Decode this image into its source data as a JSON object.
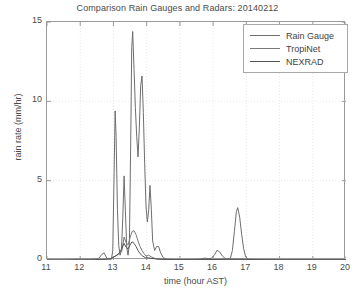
{
  "chart_data": {
    "type": "line",
    "title": "Comparison Rain Gauges and Radars: 20140212",
    "xlabel": "time (hour AST)",
    "ylabel": "rain rate (mm/hr)",
    "xlim": [
      11,
      20
    ],
    "ylim": [
      0,
      15
    ],
    "xticks": [
      11,
      12,
      13,
      14,
      15,
      16,
      17,
      18,
      19,
      20
    ],
    "yticks": [
      0,
      5,
      10,
      15
    ],
    "grid": true,
    "grid_style": "dotted",
    "legend_position": "top-right",
    "colors": {
      "rain_gauge": "#6e6e6e",
      "tropinet": "#7a7a7a",
      "nexrad": "#565656",
      "axes": "#9a9a9a",
      "grid": "#e8e8e8",
      "text": "#4a4a4a"
    },
    "series": [
      {
        "name": "Rain Gauge",
        "color": "#6e6e6e",
        "points": [
          [
            11.0,
            0.0
          ],
          [
            11.6,
            0.0
          ],
          [
            11.95,
            0.05
          ],
          [
            12.1,
            0.05
          ],
          [
            12.25,
            0.03
          ],
          [
            12.4,
            0.05
          ],
          [
            12.55,
            0.08
          ],
          [
            12.65,
            0.35
          ],
          [
            12.72,
            0.45
          ],
          [
            12.8,
            0.12
          ],
          [
            12.88,
            0.05
          ],
          [
            12.94,
            0.05
          ],
          [
            12.98,
            0.6
          ],
          [
            13.02,
            5.5
          ],
          [
            13.05,
            9.4
          ],
          [
            13.08,
            7.8
          ],
          [
            13.12,
            3.2
          ],
          [
            13.16,
            0.9
          ],
          [
            13.2,
            0.3
          ],
          [
            13.24,
            0.6
          ],
          [
            13.28,
            2.6
          ],
          [
            13.32,
            5.3
          ],
          [
            13.36,
            3.1
          ],
          [
            13.4,
            0.8
          ],
          [
            13.44,
            0.3
          ],
          [
            13.48,
            1.0
          ],
          [
            13.52,
            7.5
          ],
          [
            13.55,
            13.4
          ],
          [
            13.58,
            14.4
          ],
          [
            13.62,
            12.0
          ],
          [
            13.66,
            9.6
          ],
          [
            13.7,
            7.8
          ],
          [
            13.74,
            6.5
          ],
          [
            13.78,
            8.4
          ],
          [
            13.82,
            11.0
          ],
          [
            13.86,
            11.6
          ],
          [
            13.9,
            9.3
          ],
          [
            13.94,
            6.1
          ],
          [
            13.98,
            3.4
          ],
          [
            14.02,
            2.4
          ],
          [
            14.06,
            3.1
          ],
          [
            14.1,
            4.7
          ],
          [
            14.14,
            3.2
          ],
          [
            14.18,
            1.2
          ],
          [
            14.24,
            0.6
          ],
          [
            14.3,
            0.85
          ],
          [
            14.36,
            0.85
          ],
          [
            14.42,
            0.45
          ],
          [
            14.5,
            0.15
          ],
          [
            14.6,
            0.05
          ],
          [
            14.8,
            0.03
          ],
          [
            15.0,
            0.02
          ],
          [
            15.3,
            0.02
          ],
          [
            15.6,
            0.05
          ],
          [
            15.75,
            0.12
          ],
          [
            15.85,
            0.08
          ],
          [
            15.95,
            0.1
          ],
          [
            16.05,
            0.35
          ],
          [
            16.12,
            0.62
          ],
          [
            16.2,
            0.5
          ],
          [
            16.28,
            0.25
          ],
          [
            16.36,
            0.1
          ],
          [
            16.45,
            0.05
          ],
          [
            16.52,
            0.1
          ],
          [
            16.58,
            0.6
          ],
          [
            16.64,
            1.8
          ],
          [
            16.7,
            3.05
          ],
          [
            16.74,
            3.3
          ],
          [
            16.8,
            2.7
          ],
          [
            16.86,
            1.6
          ],
          [
            16.92,
            0.7
          ],
          [
            16.98,
            0.2
          ],
          [
            17.05,
            0.05
          ],
          [
            17.3,
            0.03
          ],
          [
            17.8,
            0.02
          ],
          [
            18.3,
            0.02
          ],
          [
            18.8,
            0.03
          ],
          [
            19.2,
            0.02
          ],
          [
            19.6,
            0.02
          ],
          [
            20.0,
            0.02
          ]
        ]
      },
      {
        "name": "TropiNet",
        "color": "#7a7a7a",
        "points": [
          [
            11.0,
            0.0
          ],
          [
            12.0,
            0.0
          ],
          [
            12.6,
            0.02
          ],
          [
            12.8,
            0.05
          ],
          [
            12.95,
            0.1
          ],
          [
            13.05,
            0.25
          ],
          [
            13.15,
            0.35
          ],
          [
            13.25,
            0.55
          ],
          [
            13.32,
            1.45
          ],
          [
            13.38,
            1.1
          ],
          [
            13.44,
            0.95
          ],
          [
            13.5,
            1.4
          ],
          [
            13.56,
            1.8
          ],
          [
            13.62,
            1.85
          ],
          [
            13.68,
            1.6
          ],
          [
            13.74,
            1.2
          ],
          [
            13.8,
            0.85
          ],
          [
            13.86,
            0.6
          ],
          [
            13.92,
            0.4
          ],
          [
            13.98,
            0.25
          ],
          [
            14.06,
            0.3
          ],
          [
            14.14,
            0.2
          ],
          [
            14.25,
            0.1
          ],
          [
            14.4,
            0.05
          ],
          [
            14.7,
            0.02
          ],
          [
            15.5,
            0.01
          ],
          [
            16.1,
            0.04
          ],
          [
            16.7,
            0.05
          ],
          [
            17.2,
            0.02
          ],
          [
            18.0,
            0.01
          ],
          [
            19.0,
            0.01
          ],
          [
            20.0,
            0.01
          ]
        ]
      },
      {
        "name": "NEXRAD",
        "color": "#565656",
        "points": [
          [
            11.0,
            0.0
          ],
          [
            12.2,
            0.0
          ],
          [
            12.7,
            0.03
          ],
          [
            12.9,
            0.08
          ],
          [
            13.0,
            0.18
          ],
          [
            13.1,
            0.3
          ],
          [
            13.18,
            0.45
          ],
          [
            13.26,
            0.75
          ],
          [
            13.32,
            1.05
          ],
          [
            13.38,
            0.8
          ],
          [
            13.44,
            0.7
          ],
          [
            13.5,
            0.95
          ],
          [
            13.56,
            1.15
          ],
          [
            13.62,
            1.05
          ],
          [
            13.68,
            0.85
          ],
          [
            13.74,
            0.6
          ],
          [
            13.8,
            0.4
          ],
          [
            13.88,
            0.25
          ],
          [
            13.96,
            0.15
          ],
          [
            14.1,
            0.12
          ],
          [
            14.3,
            0.06
          ],
          [
            14.6,
            0.03
          ],
          [
            15.2,
            0.02
          ],
          [
            16.0,
            0.03
          ],
          [
            16.4,
            0.04
          ],
          [
            16.8,
            0.04
          ],
          [
            17.5,
            0.02
          ],
          [
            18.5,
            0.01
          ],
          [
            19.5,
            0.01
          ],
          [
            20.0,
            0.01
          ]
        ]
      }
    ]
  },
  "legend": {
    "items": [
      {
        "label": "Rain Gauge"
      },
      {
        "label": "TropiNet"
      },
      {
        "label": "NEXRAD"
      }
    ]
  }
}
